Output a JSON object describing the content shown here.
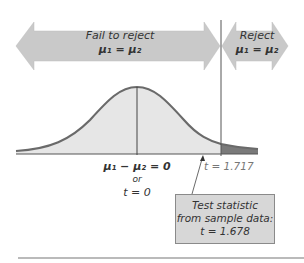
{
  "regions": {
    "fail_to_reject": {
      "label": "Fail to reject",
      "hypothesis": "μ₁ = μ₂"
    },
    "reject": {
      "label": "Reject",
      "hypothesis": "μ₁ = μ₂"
    }
  },
  "axis_labels": {
    "center_line1": "μ₁ − μ₂ = 0",
    "center_line2": "or",
    "center_line3": "t = 0",
    "critical_value": "t = 1.717"
  },
  "callout": {
    "line1": "Test statistic",
    "line2": "from sample data:",
    "line3": "t = 1.678"
  },
  "colors": {
    "arrow_fill": "#c9c9c9",
    "curve_stroke": "#6a6a6a",
    "curve_fill": "#e6e6e6",
    "reject_tail_fill": "#7a7a7a",
    "box_fill": "#d7d7d7"
  }
}
